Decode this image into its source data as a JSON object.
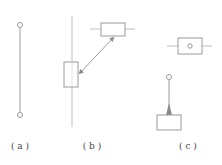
{
  "diagram": {
    "colors": {
      "stroke": "#9a9a9a",
      "fill_arrow": "#8a8a8a",
      "label": "#444444",
      "background": "#ffffff"
    },
    "panels": [
      {
        "id": "a",
        "label": "( a )"
      },
      {
        "id": "b",
        "label": "( b )"
      },
      {
        "id": "c",
        "label": "( c )"
      }
    ]
  }
}
